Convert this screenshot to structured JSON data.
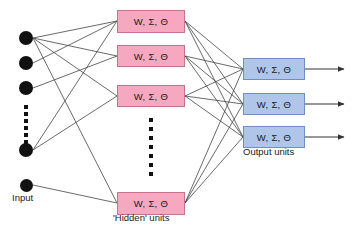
{
  "diagram": {
    "unit_label": "W, Σ, Θ",
    "colors": {
      "hidden_fill": "#f6a8c0",
      "hidden_border": "#c9728f",
      "output_fill": "#b0c5ea",
      "output_border": "#6f8fc4",
      "edge": "#444444",
      "node_dot": "#111111",
      "background": "#ffffff"
    },
    "input_layer": {
      "caption": "Input",
      "dot_count": 5,
      "ellipsis_dot_count": 6,
      "dots": [
        {
          "cx": 26,
          "cy": 38,
          "r": 7
        },
        {
          "cx": 26,
          "cy": 63,
          "r": 7
        },
        {
          "cx": 26,
          "cy": 88,
          "r": 7
        },
        {
          "cx": 26,
          "cy": 150,
          "r": 7
        },
        {
          "cx": 26,
          "cy": 185,
          "r": 6.5
        }
      ],
      "ellipsis": {
        "cx": 26,
        "y_start": 105,
        "y_step": 7,
        "size": 3.5
      }
    },
    "hidden_layer": {
      "caption": "'Hidden' units",
      "box_count": 4,
      "ellipsis_dot_count": 7,
      "boxes": [
        {
          "label": "W, Σ, Θ",
          "x": 117,
          "y": 10,
          "w": 68,
          "h": 23
        },
        {
          "label": "W, Σ, Θ",
          "x": 117,
          "y": 45,
          "w": 68,
          "h": 22
        },
        {
          "label": "W, Σ, Θ",
          "x": 117,
          "y": 85,
          "w": 68,
          "h": 22
        },
        {
          "label": "W, Σ, Θ",
          "x": 117,
          "y": 192,
          "w": 68,
          "h": 23
        }
      ],
      "ellipsis": {
        "cx": 151,
        "y_start": 118,
        "y_step": 9,
        "size": 4
      }
    },
    "output_layer": {
      "caption": "Output units",
      "box_count": 3,
      "boxes": [
        {
          "label": "W, Σ, Θ",
          "x": 243,
          "y": 58,
          "w": 62,
          "h": 22
        },
        {
          "label": "W, Σ, Θ",
          "x": 243,
          "y": 93,
          "w": 62,
          "h": 22
        },
        {
          "label": "W, Σ, Θ",
          "x": 243,
          "y": 126,
          "w": 62,
          "h": 22
        }
      ],
      "arrows": [
        {
          "x1": 305,
          "y1": 69,
          "x2": 344,
          "y2": 69
        },
        {
          "x1": 305,
          "y1": 104,
          "x2": 344,
          "y2": 104
        },
        {
          "x1": 305,
          "y1": 137,
          "x2": 344,
          "y2": 137
        }
      ]
    },
    "input_to_hidden_edges": [
      {
        "x1": 33,
        "y1": 38,
        "x2": 117,
        "y2": 21
      },
      {
        "x1": 33,
        "y1": 38,
        "x2": 117,
        "y2": 56
      },
      {
        "x1": 33,
        "y1": 38,
        "x2": 117,
        "y2": 96
      },
      {
        "x1": 33,
        "y1": 38,
        "x2": 117,
        "y2": 203
      },
      {
        "x1": 33,
        "y1": 63,
        "x2": 117,
        "y2": 21
      },
      {
        "x1": 33,
        "y1": 88,
        "x2": 117,
        "y2": 56
      },
      {
        "x1": 33,
        "y1": 150,
        "x2": 117,
        "y2": 21
      },
      {
        "x1": 33,
        "y1": 150,
        "x2": 117,
        "y2": 96
      },
      {
        "x1": 33,
        "y1": 185,
        "x2": 117,
        "y2": 203
      }
    ],
    "hidden_to_output_edges": [
      {
        "x1": 185,
        "y1": 21,
        "x2": 243,
        "y2": 69
      },
      {
        "x1": 185,
        "y1": 21,
        "x2": 243,
        "y2": 104
      },
      {
        "x1": 185,
        "y1": 21,
        "x2": 243,
        "y2": 137
      },
      {
        "x1": 185,
        "y1": 56,
        "x2": 243,
        "y2": 69
      },
      {
        "x1": 185,
        "y1": 56,
        "x2": 243,
        "y2": 104
      },
      {
        "x1": 185,
        "y1": 56,
        "x2": 243,
        "y2": 137
      },
      {
        "x1": 185,
        "y1": 96,
        "x2": 243,
        "y2": 69
      },
      {
        "x1": 185,
        "y1": 96,
        "x2": 243,
        "y2": 104
      },
      {
        "x1": 185,
        "y1": 96,
        "x2": 243,
        "y2": 137
      },
      {
        "x1": 185,
        "y1": 203,
        "x2": 243,
        "y2": 69
      },
      {
        "x1": 185,
        "y1": 203,
        "x2": 243,
        "y2": 104
      },
      {
        "x1": 185,
        "y1": 203,
        "x2": 243,
        "y2": 137
      }
    ],
    "captions": {
      "input": {
        "text": "Input",
        "x": 12,
        "y": 197
      },
      "hidden": {
        "text": "'Hidden' units",
        "x": 113,
        "y": 217
      },
      "output": {
        "text": "Output units",
        "x": 243,
        "y": 151
      }
    }
  }
}
